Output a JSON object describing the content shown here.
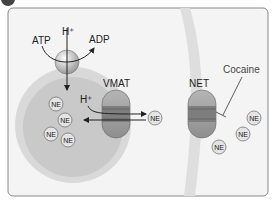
{
  "diagram": {
    "panel_badge": "",
    "labels": {
      "atp": "ATP",
      "adp": "ADP",
      "h_plus_pump": "H⁺",
      "h_plus_vmat": "H⁺",
      "vmat": "VMAT",
      "net": "NET",
      "cocaine": "Cocaine",
      "ne": "NE"
    },
    "vesicle_ne_count": 4,
    "cleft_ne_count": 4,
    "colors": {
      "panel_bg": "#f3f3f3",
      "panel_border": "#8a8a8a",
      "membrane": "#dcdcdc",
      "vesicle_outer": "#d6d6d6",
      "vesicle_inner": "#c4c4c4",
      "transporter": "#9a9a9a",
      "transporter_band": "#7a7a7a",
      "ne_circle": "#e2e2e2",
      "text": "#222222"
    }
  }
}
